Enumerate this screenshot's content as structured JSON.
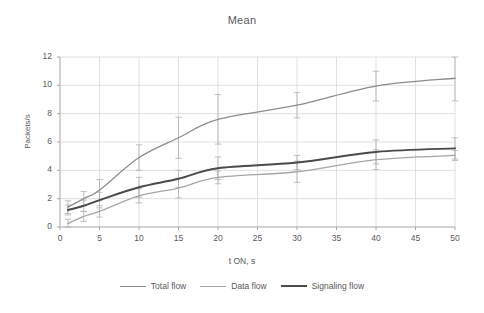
{
  "chart_data": {
    "type": "line",
    "title": "Mean",
    "xlabel": "t ON, s",
    "ylabel": "Packets/s",
    "xlim": [
      0,
      50
    ],
    "ylim": [
      0,
      12
    ],
    "xticks": [
      0,
      5,
      10,
      15,
      20,
      25,
      30,
      35,
      40,
      45,
      50
    ],
    "yticks": [
      0,
      2,
      4,
      6,
      8,
      10,
      12
    ],
    "grid": true,
    "legend_position": "bottom",
    "x": [
      1,
      3,
      5,
      10,
      15,
      20,
      30,
      40,
      50
    ],
    "series": [
      {
        "name": "Total flow",
        "color": "#8c8c8c",
        "width": 1.3,
        "values": [
          1.4,
          2.0,
          2.6,
          4.9,
          6.3,
          7.6,
          8.6,
          9.95,
          10.5
        ],
        "errors": [
          0.45,
          0.5,
          0.75,
          0.9,
          1.45,
          1.75,
          0.9,
          1.05,
          1.6
        ]
      },
      {
        "name": "Data flow",
        "color": "#a6a6a6",
        "width": 1.3,
        "values": [
          0.25,
          0.75,
          1.1,
          2.2,
          2.75,
          3.5,
          3.9,
          4.75,
          5.05
        ],
        "errors": [
          0.3,
          0.35,
          0.4,
          0.5,
          0.7,
          0.45,
          0.75,
          0.7,
          0.35
        ]
      },
      {
        "name": "Signaling flow",
        "color": "#4a4a4a",
        "width": 2.0,
        "values": [
          1.2,
          1.5,
          1.9,
          2.8,
          3.4,
          4.15,
          4.55,
          5.3,
          5.55
        ],
        "errors": [
          0.35,
          0.4,
          0.55,
          0.7,
          0.6,
          0.8,
          0.5,
          0.85,
          0.75
        ]
      }
    ]
  },
  "axes": {
    "x_tick_labels": [
      "0",
      "5",
      "10",
      "15",
      "20",
      "25",
      "30",
      "35",
      "40",
      "45",
      "50"
    ],
    "y_tick_labels": [
      "0",
      "2",
      "4",
      "6",
      "8",
      "10",
      "12"
    ]
  },
  "legend": {
    "items": [
      {
        "label": "Total flow"
      },
      {
        "label": "Data flow"
      },
      {
        "label": "Signaling flow"
      }
    ]
  },
  "colors": {
    "total_flow": "#8c8c8c",
    "data_flow": "#a6a6a6",
    "signaling_flow": "#4a4a4a",
    "grid": "#d9d9d9",
    "axis": "#a6a6a6",
    "text": "#5a5a5a",
    "background": "#ffffff"
  }
}
